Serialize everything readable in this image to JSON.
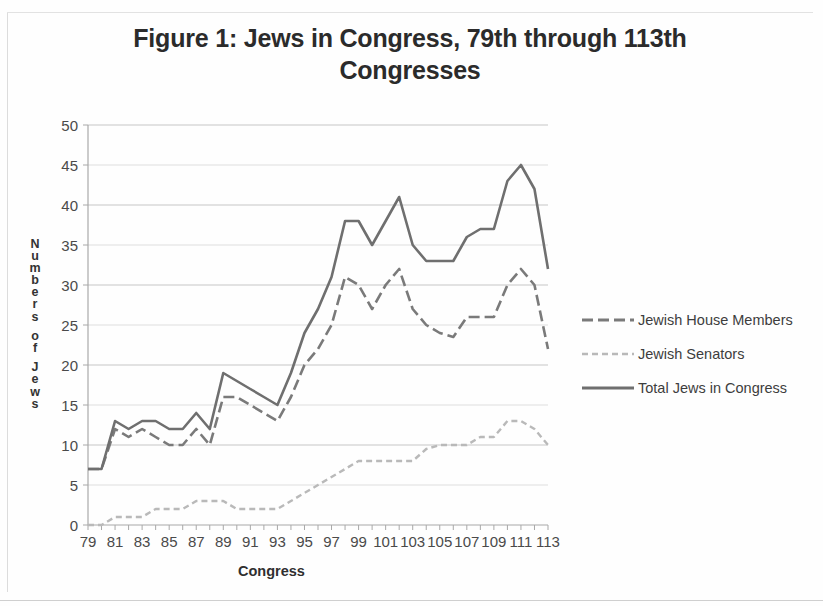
{
  "figure": {
    "title": "Figure 1:  Jews in Congress, 79th through 113th Congresses"
  },
  "axis": {
    "ylabel_letters": [
      "N",
      "u",
      "m",
      "b",
      "e",
      "r",
      "s",
      "",
      "o",
      "f",
      "",
      "J",
      "e",
      "w",
      "s"
    ],
    "xlabel": "Congress"
  },
  "legend": {
    "items": [
      {
        "label": "Jewish House Members",
        "color": "#7a7a7a",
        "style": "dashed-long"
      },
      {
        "label": "Jewish Senators",
        "color": "#b9b9b9",
        "style": "dashed-short"
      },
      {
        "label": "Total Jews in Congress",
        "color": "#6f6f6f",
        "style": "solid"
      }
    ]
  },
  "chart_data": {
    "type": "line",
    "title": "Figure 1:  Jews in Congress, 79th through 113th Congresses",
    "xlabel": "Congress",
    "ylabel": "Numbers of Jews",
    "xlim": [
      79,
      113
    ],
    "ylim": [
      0,
      50
    ],
    "ytick_values": [
      0,
      5,
      10,
      15,
      20,
      25,
      30,
      35,
      40,
      45,
      50
    ],
    "xtick_values": [
      79,
      81,
      83,
      85,
      87,
      89,
      91,
      93,
      95,
      97,
      99,
      101,
      103,
      105,
      107,
      109,
      111,
      113
    ],
    "x": [
      79,
      80,
      81,
      82,
      83,
      84,
      85,
      86,
      87,
      88,
      89,
      90,
      91,
      92,
      93,
      94,
      95,
      96,
      97,
      98,
      99,
      100,
      101,
      102,
      103,
      104,
      105,
      106,
      107,
      108,
      109,
      110,
      111,
      112,
      113
    ],
    "grid": "horizontal",
    "legend_position": "right",
    "series": [
      {
        "name": "Jewish House Members",
        "color": "#7a7a7a",
        "style": "dashed-long",
        "values": [
          7,
          7,
          12,
          11,
          12,
          11,
          10,
          10,
          12,
          10,
          16,
          16,
          15,
          14,
          13,
          16,
          20,
          22,
          25,
          31,
          30,
          27,
          30,
          32,
          27,
          25,
          24,
          23.5,
          26,
          26,
          26,
          30,
          32,
          30,
          22
        ]
      },
      {
        "name": "Jewish Senators",
        "color": "#b9b9b9",
        "style": "dashed-short",
        "values": [
          0,
          0,
          1,
          1,
          1,
          2,
          2,
          2,
          3,
          3,
          3,
          2,
          2,
          2,
          2,
          3,
          4,
          5,
          6,
          7,
          8,
          8,
          8,
          8,
          8,
          9.5,
          10,
          10,
          10,
          11,
          11,
          13,
          13,
          12,
          10
        ]
      },
      {
        "name": "Total Jews in Congress",
        "color": "#6f6f6f",
        "style": "solid",
        "values": [
          7,
          7,
          13,
          12,
          13,
          13,
          12,
          12,
          14,
          12,
          19,
          18,
          17,
          16,
          15,
          19,
          24,
          27,
          31,
          38,
          38,
          35,
          38,
          41,
          35,
          33,
          33,
          33,
          36,
          37,
          37,
          43,
          45,
          42,
          32
        ]
      }
    ]
  }
}
